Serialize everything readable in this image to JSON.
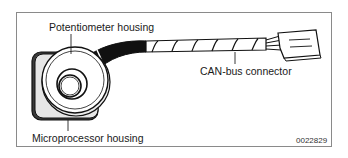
{
  "figure": {
    "labels": {
      "potentiometer_housing": "Potentiometer housing",
      "can_bus_connector": "CAN-bus connector",
      "microprocessor_housing": "Microprocessor housing"
    },
    "figure_number": "0022829"
  }
}
